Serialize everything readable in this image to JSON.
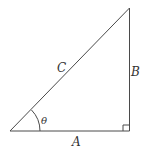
{
  "diagram": {
    "type": "right-triangle",
    "labels": {
      "hypotenuse": "C",
      "opposite": "B",
      "adjacent": "A",
      "angle": "θ"
    },
    "colors": {
      "stroke": "#4a4a4a",
      "text": "#333333",
      "background": "#ffffff"
    }
  }
}
